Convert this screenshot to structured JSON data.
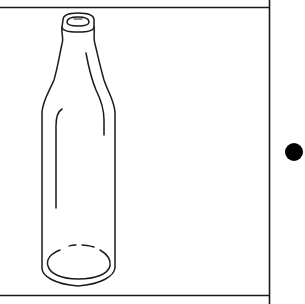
{
  "figure": {
    "alt": "Outline drawing of an empty glass bottle inside a rectangular frame with a black dot to the right",
    "colors": {
      "background": "#ffffff",
      "line": "#1a1a1a",
      "dot": "#000000"
    },
    "icons": [
      "bottle-icon",
      "dot-marker-icon"
    ]
  }
}
